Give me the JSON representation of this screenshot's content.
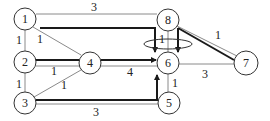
{
  "diagram": {
    "type": "network-flow-graph",
    "colors": {
      "thin_edge": "#8a8a8a",
      "flow_edge": "#1a1a1a",
      "node_stroke": "#333333",
      "text": "#222222"
    },
    "nodes": [
      {
        "id": "1",
        "label": "1",
        "x": 25,
        "y": 19
      },
      {
        "id": "2",
        "label": "2",
        "x": 25,
        "y": 62
      },
      {
        "id": "3",
        "label": "3",
        "x": 25,
        "y": 103
      },
      {
        "id": "4",
        "label": "4",
        "x": 90,
        "y": 63
      },
      {
        "id": "5",
        "label": "5",
        "x": 169,
        "y": 103
      },
      {
        "id": "6",
        "label": "6",
        "x": 168,
        "y": 63
      },
      {
        "id": "7",
        "label": "7",
        "x": 246,
        "y": 63
      },
      {
        "id": "8",
        "label": "8",
        "x": 168,
        "y": 20
      }
    ],
    "edges": [
      {
        "from": "1",
        "to": "8",
        "weight": "3"
      },
      {
        "from": "1",
        "to": "2",
        "weight": "1"
      },
      {
        "from": "1",
        "to": "4",
        "weight": "1"
      },
      {
        "from": "2",
        "to": "3",
        "weight": "1"
      },
      {
        "from": "2",
        "to": "4",
        "weight": "1"
      },
      {
        "from": "3",
        "to": "4",
        "weight": "1"
      },
      {
        "from": "3",
        "to": "5",
        "weight": "3"
      },
      {
        "from": "4",
        "to": "6",
        "weight": "4"
      },
      {
        "from": "8",
        "to": "6",
        "weight": "1"
      },
      {
        "from": "8",
        "to": "7",
        "weight": "1"
      },
      {
        "from": "6",
        "to": "7",
        "weight": "3"
      },
      {
        "from": "5",
        "to": "6",
        "weight": "1"
      }
    ],
    "flow_paths": [
      {
        "route": "1 → 6",
        "arrow_into": "6"
      },
      {
        "route": "2 → 4 → 6",
        "arrow_into": "6"
      },
      {
        "route": "3 → 6",
        "arrow_into": "6"
      },
      {
        "route": "8 → 6",
        "arrow_into": "6"
      },
      {
        "route": "8 → 7",
        "arrow_into": "7"
      }
    ],
    "annotation": "ellipse around incoming arrows to node 6"
  }
}
